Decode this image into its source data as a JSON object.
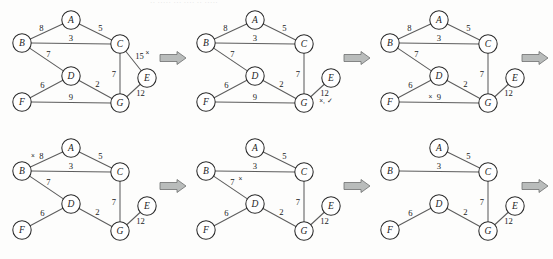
{
  "figure": {
    "title_artifact": "·· ····· ··· ···· ·· ·····",
    "background": "#fdfdfc",
    "edge_color": "#5d5d5d",
    "node_fill": "#ffffff",
    "node_stroke": "#2b2b2b",
    "arrow_fill": "#b9bcbb",
    "arrow_stroke": "#6d6f6e",
    "arrow_glyph": "right-block-arrow",
    "panel_count": 6,
    "row_count": 2
  },
  "chart_data": {
    "type": "diagram",
    "xlabel": "",
    "ylabel": "",
    "legend": [],
    "nodes": [
      "A",
      "B",
      "C",
      "D",
      "E",
      "F",
      "G"
    ],
    "node_positions": {
      "A": [
        63,
        14
      ],
      "B": [
        14,
        37
      ],
      "C": [
        112,
        38
      ],
      "D": [
        63,
        70
      ],
      "E": [
        139,
        72
      ],
      "F": [
        14,
        96
      ],
      "G": [
        112,
        97
      ]
    },
    "all_edges": [
      {
        "id": "AB",
        "from": "A",
        "to": "B",
        "weight": 8
      },
      {
        "id": "AC",
        "from": "A",
        "to": "C",
        "weight": 5
      },
      {
        "id": "BC",
        "from": "B",
        "to": "C",
        "weight": 3
      },
      {
        "id": "BD",
        "from": "B",
        "to": "D",
        "weight": 7
      },
      {
        "id": "CE",
        "from": "C",
        "to": "E",
        "weight": 15
      },
      {
        "id": "CG",
        "from": "C",
        "to": "G",
        "weight": 7
      },
      {
        "id": "DF",
        "from": "D",
        "to": "F",
        "weight": 6
      },
      {
        "id": "DG",
        "from": "D",
        "to": "G",
        "weight": 2
      },
      {
        "id": "FG",
        "from": "F",
        "to": "G",
        "weight": 9
      },
      {
        "id": "EG",
        "from": "E",
        "to": "G",
        "weight": 12
      }
    ],
    "panels": [
      {
        "index": 1,
        "caption": "",
        "edges": [
          "AB",
          "AC",
          "BC",
          "BD",
          "CE",
          "CG",
          "DF",
          "DG",
          "FG",
          "EG"
        ],
        "marks": [
          {
            "edge": "CE",
            "symbol": "×",
            "side": "after"
          }
        ]
      },
      {
        "index": 2,
        "caption": "",
        "edges": [
          "AB",
          "AC",
          "BC",
          "BD",
          "CG",
          "DF",
          "DG",
          "FG",
          "EG"
        ],
        "marks": [
          {
            "edge": "EG",
            "symbol": "×, ✓",
            "side": "below"
          }
        ]
      },
      {
        "index": 3,
        "caption": "",
        "edges": [
          "AB",
          "AC",
          "BC",
          "BD",
          "CG",
          "DF",
          "DG",
          "FG",
          "EG"
        ],
        "marks": [
          {
            "edge": "FG",
            "symbol": "×",
            "side": "before"
          }
        ]
      },
      {
        "index": 4,
        "caption": "",
        "edges": [
          "AB",
          "AC",
          "BC",
          "BD",
          "CG",
          "DF",
          "DG",
          "EG"
        ],
        "marks": [
          {
            "edge": "AB",
            "symbol": "×",
            "side": "before"
          }
        ]
      },
      {
        "index": 5,
        "caption": "",
        "edges": [
          "AC",
          "BC",
          "BD",
          "CG",
          "DF",
          "DG",
          "EG"
        ],
        "marks": [
          {
            "edge": "BD",
            "symbol": "×",
            "side": "after"
          }
        ]
      },
      {
        "index": 6,
        "caption": "",
        "edges": [
          "AC",
          "BC",
          "CG",
          "DF",
          "DG",
          "EG"
        ],
        "marks": []
      }
    ],
    "weight_labels": {
      "AB": "8",
      "AC": "5",
      "BC": "3",
      "BD": "7",
      "CE": "15",
      "CG": "7",
      "DF": "6",
      "DG": "2",
      "FG": "9",
      "EG": "12"
    },
    "final_mst_edges": [
      "AC",
      "BC",
      "CG",
      "DF",
      "DG",
      "EG"
    ],
    "final_mst_weight": 35
  }
}
